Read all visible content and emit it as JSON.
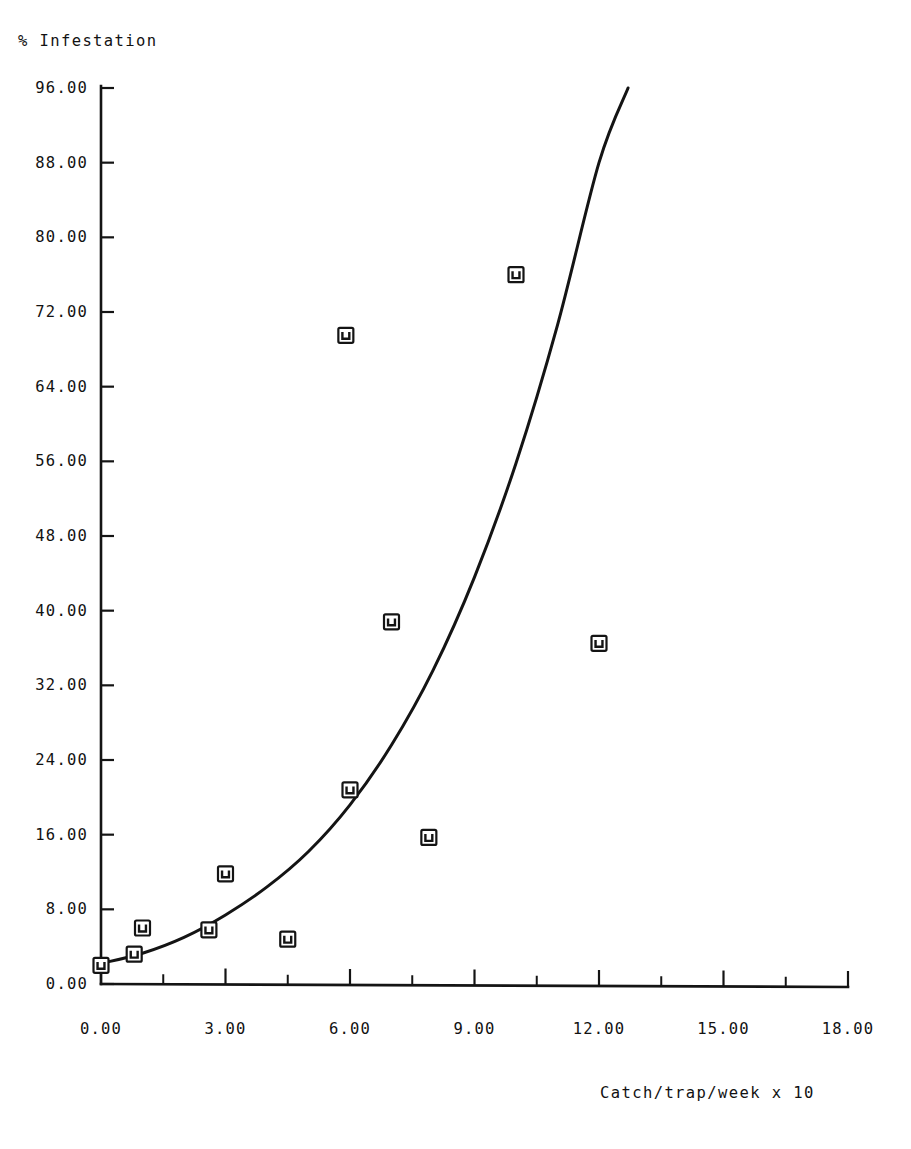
{
  "figure": {
    "background_color": "#ffffff",
    "ink_color": "#141414"
  },
  "axes": {
    "y_axis_title": "% Infestation",
    "x_axis_title": "Catch/trap/week x 10",
    "y_tick_labels": [
      "96.00",
      "88.00",
      "80.00",
      "72.00",
      "64.00",
      "56.00",
      "48.00",
      "40.00",
      "32.00",
      "24.00",
      "16.00",
      "8.00",
      "0.00"
    ],
    "x_tick_labels": [
      "0.00",
      "3.00",
      "6.00",
      "9.00",
      "12.00",
      "15.00",
      "18.00"
    ]
  },
  "chart_data": {
    "type": "scatter",
    "title": "",
    "subtitle": "",
    "xlabel": "Catch/trap/week x 10",
    "ylabel": "% Infestation",
    "xlim": [
      0,
      18
    ],
    "ylim": [
      0,
      96
    ],
    "xticks": [
      0,
      3,
      6,
      9,
      12,
      15,
      18
    ],
    "yticks": [
      0,
      8,
      16,
      24,
      32,
      40,
      48,
      56,
      64,
      72,
      80,
      88,
      96
    ],
    "x_minor_tick_step": 1.5,
    "y_minor_ticks": false,
    "grid": false,
    "legend": false,
    "legend_position": "none",
    "marker_style": "open-square-with-u-glyph",
    "series": [
      {
        "name": "Observed infestation",
        "type": "scatter",
        "points": [
          {
            "x": 0.0,
            "y": 2.0
          },
          {
            "x": 0.8,
            "y": 3.2
          },
          {
            "x": 1.0,
            "y": 6.0
          },
          {
            "x": 2.6,
            "y": 5.8
          },
          {
            "x": 3.0,
            "y": 11.8
          },
          {
            "x": 4.5,
            "y": 4.8
          },
          {
            "x": 5.9,
            "y": 69.5
          },
          {
            "x": 6.0,
            "y": 20.8
          },
          {
            "x": 7.0,
            "y": 38.8
          },
          {
            "x": 7.9,
            "y": 15.7
          },
          {
            "x": 10.0,
            "y": 76.0
          },
          {
            "x": 12.0,
            "y": 36.5
          }
        ]
      },
      {
        "name": "Fitted exponential curve",
        "type": "line",
        "points": [
          {
            "x": 0.0,
            "y": 2.2
          },
          {
            "x": 1.0,
            "y": 3.3
          },
          {
            "x": 2.0,
            "y": 5.0
          },
          {
            "x": 3.0,
            "y": 7.4
          },
          {
            "x": 4.0,
            "y": 10.4
          },
          {
            "x": 5.0,
            "y": 14.2
          },
          {
            "x": 6.0,
            "y": 19.2
          },
          {
            "x": 7.0,
            "y": 25.6
          },
          {
            "x": 8.0,
            "y": 33.6
          },
          {
            "x": 9.0,
            "y": 43.6
          },
          {
            "x": 10.0,
            "y": 55.8
          },
          {
            "x": 11.0,
            "y": 70.6
          },
          {
            "x": 12.0,
            "y": 88.0
          },
          {
            "x": 12.7,
            "y": 96.0
          }
        ]
      }
    ]
  }
}
